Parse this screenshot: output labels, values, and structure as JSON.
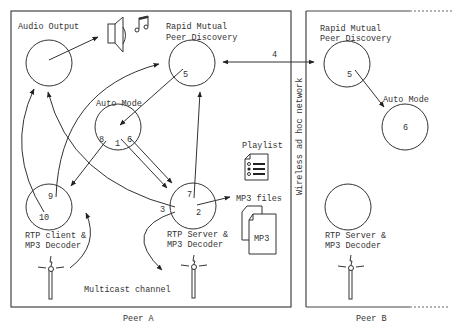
{
  "peer_a": {
    "label": "Peer A",
    "nodes": {
      "audio_output": {
        "label": "Audio Output"
      },
      "rmpd": {
        "label_line1": "Rapid Mutual",
        "label_line2": "Peer Discovery",
        "num": "5"
      },
      "auto_mode": {
        "label": "Auto Mode",
        "num_in": "1",
        "num_left": "8",
        "num_right": "6"
      },
      "rtp_client": {
        "label_line1": "RTP client &",
        "label_line2": "MP3 Decoder",
        "num_top": "9",
        "num_bottom": "10"
      },
      "rtp_server": {
        "label_line1": "RTP Server &",
        "label_line2": "MP3 Decoder",
        "num_top": "7",
        "num_left": "3",
        "num_right": "2"
      }
    },
    "playlist": {
      "label": "Playlist"
    },
    "mp3_files": {
      "label": "MP3 files",
      "doc_label": "MP3"
    },
    "multicast": {
      "label": "Multicast channel"
    }
  },
  "network": {
    "label": "Wireless ad hoc network",
    "link_num": "4"
  },
  "peer_b": {
    "label": "Peer B",
    "nodes": {
      "rmpd": {
        "label_line1": "Rapid Mutual",
        "label_line2": "Peer Discovery",
        "num": "5"
      },
      "auto_mode": {
        "label": "Auto Mode",
        "num": "6"
      },
      "rtp_server": {
        "label_line1": "RTP Server &",
        "label_line2": "MP3 Decoder"
      }
    }
  }
}
